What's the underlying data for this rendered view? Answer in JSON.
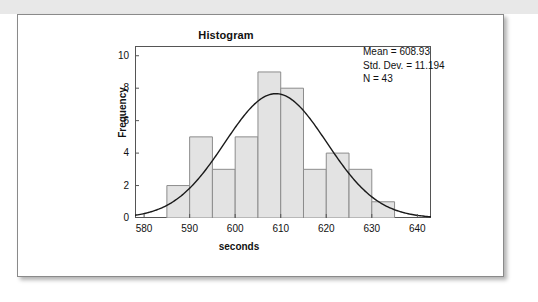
{
  "figure": {
    "title": "Histogram"
  },
  "stats": {
    "mean_label": "Mean = 608.93",
    "sd_label": "Std. Dev. = 11.194",
    "n_label": "N = 43"
  },
  "colors": {
    "bar_fill": "#e3e3e3",
    "bar_stroke": "#8c8c8c",
    "curve": "#1a1a1a",
    "frame": "#555555",
    "card_bg": "#ffffff",
    "strip_bg": "#e8e8e8"
  },
  "chart_data": {
    "type": "bar",
    "title": "Histogram",
    "xlabel": "seconds",
    "ylabel": "Frequency",
    "xlim": [
      578,
      643
    ],
    "ylim": [
      0,
      10.6
    ],
    "grid": false,
    "legend": null,
    "bin_width": 5,
    "bin_edges": [
      585,
      590,
      595,
      600,
      605,
      610,
      615,
      620,
      625,
      630,
      635
    ],
    "categories": [
      "585-590",
      "590-595",
      "595-600",
      "600-605",
      "605-610",
      "610-615",
      "615-620",
      "620-625",
      "625-630",
      "630-635"
    ],
    "bin_centers": [
      587.5,
      592.5,
      597.5,
      602.5,
      607.5,
      612.5,
      617.5,
      622.5,
      627.5,
      632.5
    ],
    "values": [
      2,
      5,
      3,
      5,
      9,
      8,
      3,
      4,
      3,
      1
    ],
    "xticks": [
      580,
      590,
      600,
      610,
      620,
      630,
      640
    ],
    "yticks": [
      0,
      2,
      4,
      6,
      8,
      10
    ],
    "overlay": {
      "type": "normal_curve",
      "mean": 608.93,
      "std_dev": 11.194,
      "n": 43,
      "peak_value": 7.66
    },
    "annotations": [
      "Mean = 608.93",
      "Std. Dev. = 11.194",
      "N = 43"
    ]
  }
}
